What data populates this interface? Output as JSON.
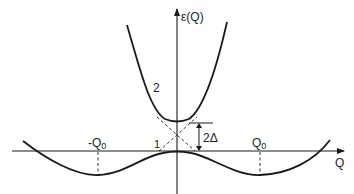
{
  "diagram": {
    "type": "energy-level-diagram",
    "y_axis_label": "ε(Q)",
    "x_axis_label": "Q",
    "curve_upper_label": "2",
    "curve_lower_label": "1",
    "gap_label": "2Δ",
    "left_min_label": "-Q",
    "left_min_sub": "0",
    "right_min_label": "Q",
    "right_min_sub": "0",
    "line_color": "#1a1a1a"
  }
}
